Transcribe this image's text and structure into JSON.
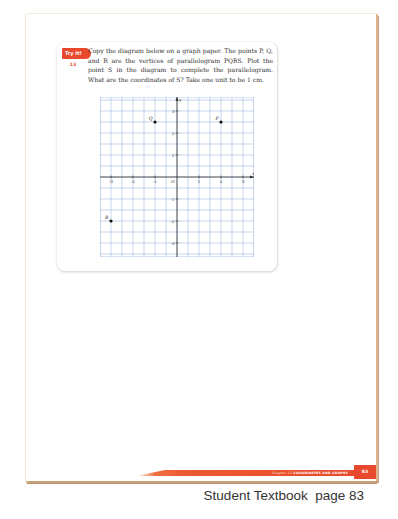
{
  "badge": {
    "label": "Try It!",
    "number": "13"
  },
  "problem": {
    "text": "Copy the diagram below on a graph paper. The points P, Q, and R are the vertices of parallelogram PQRS. Plot the point S in the diagram to complete the parallelogram. What are the coordinates of S? Take one unit to be 1 cm."
  },
  "footer": {
    "chapter": "Chapter 13",
    "chapter_title": "COORDINATES AND GRAPHS",
    "page_number": "83"
  },
  "caption": "Student Textbook  page 83",
  "colors": {
    "accent": "#e8492e",
    "grid": "#9db8e0",
    "page_edge": "#d9b48c"
  },
  "chart_data": {
    "type": "scatter",
    "title": "",
    "xlabel": "x",
    "ylabel": "y",
    "xlim": [
      -3.5,
      3.5
    ],
    "ylim": [
      -3.5,
      3.5
    ],
    "grid": true,
    "grid_step": 0.5,
    "x_ticks": [
      "-3",
      "-2",
      "-1",
      "O",
      "1",
      "2",
      "3"
    ],
    "y_ticks": [
      "3",
      "2",
      "1",
      "-1",
      "-2",
      "-3"
    ],
    "origin_label": "O",
    "points": [
      {
        "label": "P",
        "x": 2,
        "y": 2.5
      },
      {
        "label": "Q",
        "x": -1,
        "y": 2.5
      },
      {
        "label": "R",
        "x": -3,
        "y": -2
      }
    ]
  }
}
